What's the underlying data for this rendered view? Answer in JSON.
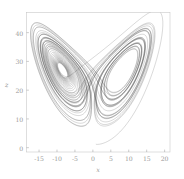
{
  "chart_data": {
    "type": "line",
    "title": "",
    "xlabel": "x",
    "ylabel": "z",
    "xlim": [
      -18.5,
      21.5
    ],
    "ylim": [
      -1.5,
      47.0
    ],
    "xticks": [
      -15,
      -10,
      -5,
      0,
      5,
      10,
      15,
      20
    ],
    "xtick_labels": [
      "-15",
      "-10",
      "-5",
      "0",
      "5",
      "10",
      "15",
      "20"
    ],
    "yticks": [
      0,
      10,
      20,
      30,
      40
    ],
    "ytick_labels": [
      "0",
      "10",
      "20",
      "30",
      "40"
    ],
    "grid": false,
    "legend": null,
    "line_color": "#3c3c3c",
    "frame_color": "#c8c8c8",
    "tick_color": "#9a9a9a",
    "background": "#ffffff",
    "system": {
      "name": "Lorenz",
      "sigma": 10,
      "rho": 28,
      "beta": 2.6666666667,
      "dt": 0.0055,
      "steps": 9200,
      "initial_state": [
        0.9,
        1.4,
        1.2
      ]
    },
    "fixed_points": [
      {
        "label": "C-",
        "x": -8.485,
        "z": 27.0
      },
      {
        "label": "C+",
        "x": 8.485,
        "z": 27.0
      }
    ],
    "series": [
      {
        "name": "trajectory",
        "projection": "x-z",
        "color": "#3c3c3c",
        "width": 0.35,
        "opacity": 0.55
      }
    ]
  },
  "axes": {
    "left_px": 26.5,
    "right_px": 170.0,
    "top_px": 12.5,
    "bottom_px": 152.0,
    "tick_length_px": 2.4
  }
}
